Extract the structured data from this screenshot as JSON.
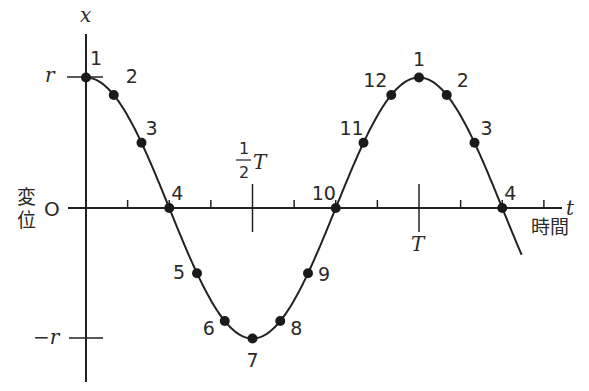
{
  "axes": {
    "y_label": "x",
    "x_label": "t",
    "x_caption": "時間",
    "y_caption_line1": "変",
    "y_caption_line2": "位",
    "origin_label": "O",
    "r_label": "r",
    "neg_r_label": "−r",
    "half_period_label_num": "1",
    "half_period_label_den": "2",
    "half_period_label_T": "T",
    "period_label": "T"
  },
  "points": [
    {
      "label": "1",
      "phase": 0
    },
    {
      "label": "2",
      "phase": 1
    },
    {
      "label": "3",
      "phase": 2
    },
    {
      "label": "4",
      "phase": 3
    },
    {
      "label": "5",
      "phase": 4
    },
    {
      "label": "6",
      "phase": 5
    },
    {
      "label": "7",
      "phase": 6
    },
    {
      "label": "8",
      "phase": 7
    },
    {
      "label": "9",
      "phase": 8
    },
    {
      "label": "10",
      "phase": 9
    },
    {
      "label": "11",
      "phase": 10
    },
    {
      "label": "12",
      "phase": 11
    },
    {
      "label": "1",
      "phase": 12
    },
    {
      "label": "2",
      "phase": 13
    },
    {
      "label": "3",
      "phase": 14
    },
    {
      "label": "4",
      "phase": 15
    }
  ],
  "geometry": {
    "origin_x": 86,
    "axis_y": 208,
    "amplitude_px": 130.5,
    "period_px": 333,
    "curve_end_x": 522
  },
  "colors": {
    "ink": "#222222",
    "background": "#ffffff"
  }
}
